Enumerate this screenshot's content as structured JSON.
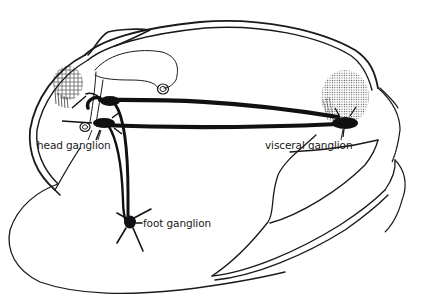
{
  "diagram": {
    "labels": {
      "head_ganglion": "head ganglion",
      "visceral_ganglion": "visceral ganglion",
      "foot_ganglion": "foot ganglion"
    },
    "colors": {
      "ink": "#1a1a1a",
      "background": "#ffffff"
    }
  }
}
